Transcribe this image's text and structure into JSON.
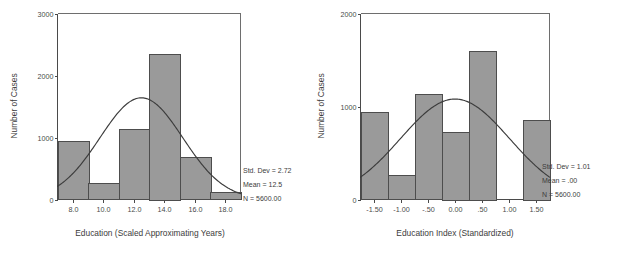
{
  "figure": {
    "background_color": "#ffffff",
    "bar_fill_color": "#9a9a9a",
    "bar_edge_color": "#4d4d4d",
    "curve_color": "#3c3c3c",
    "axis_color": "#4a4a4a"
  },
  "charts": [
    {
      "id": "education-years-histogram",
      "title": "",
      "xlabel": "Education (Scaled Approximating Years)",
      "ylabel": "Number of Cases",
      "y_ticks": [
        "0",
        "1000",
        "2000",
        "3000"
      ],
      "x_ticks": [
        "8.0",
        "10.0",
        "12.0",
        "14.0",
        "16.0",
        "18.0"
      ],
      "stats": {
        "std_dev": "Std. Dev = 2.72",
        "mean": "Mean = 12.5",
        "n": "N = 5600.00"
      }
    },
    {
      "id": "education-index-histogram",
      "title": "",
      "xlabel": "Education Index (Standardized)",
      "ylabel": "Number of Cases",
      "y_ticks": [
        "0",
        "1000",
        "2000"
      ],
      "x_ticks": [
        "-1.50",
        "-1.00",
        "-.50",
        "0.00",
        ".50",
        "1.00",
        "1.50"
      ],
      "stats": {
        "std_dev": "Std. Dev = 1.01",
        "mean": "Mean = .00",
        "n": "N = 5600.00"
      }
    }
  ],
  "chart_data": [
    {
      "type": "bar",
      "id": "education-years-histogram",
      "title": "Education (Scaled Approximating Years)",
      "xlabel": "Education (Scaled Approximating Years)",
      "ylabel": "Number of Cases",
      "xlim": [
        7.0,
        19.0
      ],
      "ylim": [
        0,
        3000
      ],
      "bin_width": 2.0,
      "grid": false,
      "legend": "none",
      "bin_edges": [
        7.0,
        9.0,
        11.0,
        13.0,
        15.0,
        17.0,
        19.0
      ],
      "bin_centers": [
        8.0,
        10.0,
        12.0,
        14.0,
        16.0,
        18.0
      ],
      "categories": [
        "7-9",
        "9-11",
        "11-13",
        "13-15",
        "15-17",
        "17-19"
      ],
      "values": [
        940,
        260,
        1130,
        2350,
        680,
        120
      ],
      "overlay": {
        "type": "normal-curve",
        "mean": 12.5,
        "std_dev": 2.72,
        "n": 5600,
        "peak_value": 1640
      },
      "annotations": [
        "Std. Dev = 2.72",
        "Mean = 12.5",
        "N = 5600.00"
      ],
      "y_tick_values": [
        0,
        1000,
        2000,
        3000
      ],
      "x_tick_values": [
        8.0,
        10.0,
        12.0,
        14.0,
        16.0,
        18.0
      ]
    },
    {
      "type": "bar",
      "id": "education-index-histogram",
      "title": "Education Index (Standardized)",
      "xlabel": "Education Index (Standardized)",
      "ylabel": "Number of Cases",
      "xlim": [
        -1.75,
        1.75
      ],
      "ylim": [
        0,
        2000
      ],
      "bin_width": 0.5,
      "grid": false,
      "legend": "none",
      "bin_edges": [
        -1.75,
        -1.25,
        -0.75,
        -0.25,
        0.25,
        0.75,
        1.25,
        1.75
      ],
      "bin_centers": [
        -1.5,
        -1.0,
        -0.5,
        0.0,
        0.5,
        1.0,
        1.5
      ],
      "categories": [
        "-1.75--1.25",
        "-1.25--0.75",
        "-0.75--0.25",
        "-0.25-0.25",
        "0.25-0.75",
        "0.75-1.25",
        "1.25-1.75"
      ],
      "values": [
        940,
        260,
        1130,
        730,
        1600,
        0,
        860
      ],
      "overlay": {
        "type": "normal-curve",
        "mean": 0.0,
        "std_dev": 1.01,
        "n": 5600,
        "peak_value": 1080
      },
      "annotations": [
        "Std. Dev = 1.01",
        "Mean = .00",
        "N = 5600.00"
      ],
      "y_tick_values": [
        0,
        1000,
        2000
      ],
      "x_tick_values": [
        -1.5,
        -1.0,
        -0.5,
        0.0,
        0.5,
        1.0,
        1.5
      ]
    }
  ]
}
